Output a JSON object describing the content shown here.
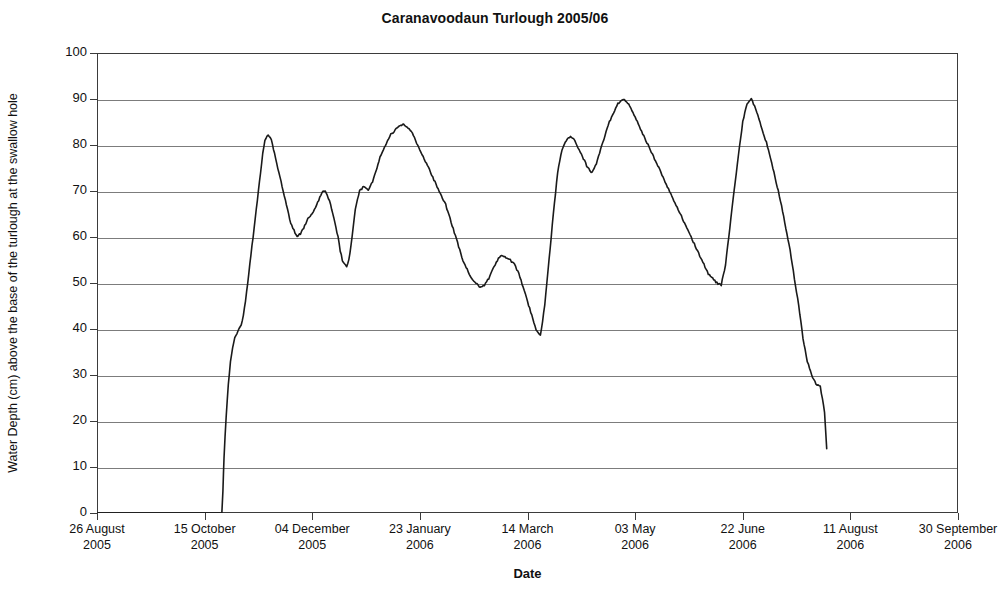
{
  "chart_data": {
    "type": "line",
    "title": "Caranavoodaun Turlough 2005/06",
    "xlabel": "Date",
    "ylabel": "Water Depth (cm) above the base of the turlough at the swallow hole",
    "ylim": [
      0,
      100
    ],
    "yticks": [
      0,
      10,
      20,
      30,
      40,
      50,
      60,
      70,
      80,
      90,
      100
    ],
    "ytick_labels": [
      "0",
      "10",
      "20",
      "30",
      "40",
      "50",
      "60",
      "70",
      "80",
      "90",
      "100"
    ],
    "grid": true,
    "legend": "none",
    "xtick_labels": [
      {
        "date": "26 August",
        "year": "2005"
      },
      {
        "date": "15 October",
        "year": "2005"
      },
      {
        "date": "04 December",
        "year": "2005"
      },
      {
        "date": "23 January",
        "year": "2006"
      },
      {
        "date": "14 March",
        "year": "2006"
      },
      {
        "date": "03 May",
        "year": "2006"
      },
      {
        "date": "22 June",
        "year": "2006"
      },
      {
        "date": "11 August",
        "year": "2006"
      },
      {
        "date": "30 September",
        "year": "2006"
      }
    ],
    "xlim_days": [
      0,
      400
    ],
    "xtick_days": [
      0,
      50,
      100,
      150,
      200,
      250,
      300,
      350,
      400
    ],
    "line_color": "#1a1a1a",
    "series": [
      {
        "name": "Water depth",
        "x_days": [
          0,
          10,
          20,
          30,
          40,
          50,
          55,
          58,
          58.5,
          59,
          60,
          61,
          62,
          63,
          64,
          65,
          66,
          67,
          68,
          69,
          70,
          71,
          72,
          73,
          74,
          75,
          76,
          77,
          78,
          79,
          80,
          81,
          82,
          83,
          84,
          85,
          86,
          87,
          88,
          89,
          90,
          91,
          92,
          93,
          94,
          95,
          96,
          97,
          98,
          99,
          100,
          101,
          102,
          103,
          104,
          105,
          106,
          107,
          108,
          109,
          110,
          111,
          112,
          113,
          114,
          115,
          116,
          117,
          118,
          119,
          120,
          122,
          124,
          126,
          128,
          130,
          132,
          134,
          136,
          138,
          140,
          142,
          144,
          146,
          148,
          150,
          152,
          154,
          156,
          158,
          160,
          162,
          164,
          166,
          168,
          170,
          172,
          174,
          176,
          178,
          180,
          182,
          184,
          186,
          188,
          190,
          192,
          194,
          196,
          198,
          200,
          202,
          204,
          206,
          208,
          210,
          212,
          214,
          216,
          218,
          220,
          222,
          224,
          226,
          228,
          230,
          232,
          234,
          236,
          238,
          240,
          242,
          244,
          246,
          248,
          250,
          252,
          254,
          256,
          258,
          260,
          262,
          264,
          266,
          268,
          270,
          272,
          274,
          276,
          278,
          280,
          282,
          284,
          286,
          288,
          290,
          292,
          294,
          296,
          298,
          300,
          302,
          304,
          306,
          308,
          310,
          312,
          314,
          316,
          318,
          320,
          322,
          324,
          326,
          328,
          330,
          332,
          334,
          336,
          338,
          339
        ],
        "y_depth": [
          0,
          0,
          0,
          0,
          0,
          0,
          0,
          0,
          5,
          12,
          21,
          28,
          33,
          36,
          38,
          39,
          40,
          41,
          43,
          46,
          50,
          54,
          58,
          62,
          66,
          70,
          74,
          78,
          81,
          82,
          82,
          81,
          79,
          77,
          75,
          73,
          71,
          69,
          67,
          65,
          63,
          62,
          61,
          60,
          60.5,
          61,
          62,
          63,
          64,
          64.5,
          65,
          66,
          67,
          68,
          69,
          70,
          70,
          69,
          68,
          66,
          64,
          62,
          60,
          57,
          55,
          54,
          53.5,
          55,
          58,
          62,
          66,
          70,
          71,
          70,
          72,
          75,
          78,
          80,
          82,
          83,
          84,
          84.5,
          84,
          83,
          81,
          79,
          77,
          75,
          73,
          71,
          69,
          67,
          64,
          61,
          58,
          55,
          53,
          51,
          50,
          49,
          49.5,
          51,
          53,
          55,
          56,
          55.5,
          55,
          54,
          52,
          49,
          46,
          43,
          40,
          38.5,
          45,
          55,
          65,
          74,
          79,
          81,
          82,
          81,
          79,
          77,
          75,
          74,
          76,
          79,
          82,
          85,
          87,
          89,
          90,
          89.5,
          88,
          86,
          84,
          82,
          80,
          78,
          76,
          74,
          72,
          70,
          68,
          66,
          64,
          62,
          60,
          58,
          56,
          54,
          52,
          51,
          50,
          49.5,
          54,
          62,
          70,
          78,
          85,
          89,
          90,
          88,
          85,
          82,
          79,
          75,
          71,
          67,
          62,
          57,
          51,
          45,
          38,
          33,
          30,
          28,
          27.5,
          22,
          14,
          6,
          0
        ]
      }
    ]
  },
  "axes": {
    "y_tick_count": 11,
    "x_tick_count": 9
  }
}
